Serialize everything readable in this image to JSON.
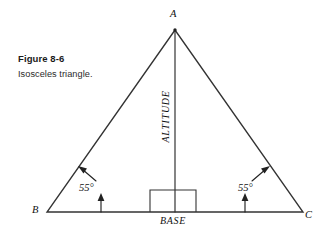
{
  "figure": {
    "caption_title": "Figure 8-6",
    "caption_subtitle": "Isosceles triangle.",
    "vertices": {
      "apex_label": "A",
      "left_label": "B",
      "right_label": "C"
    },
    "labels": {
      "altitude": "ALTITUDE",
      "base": "BASE"
    },
    "angles": {
      "left_angle": "55°",
      "right_angle": "55°"
    },
    "colors": {
      "background": "#ffffff",
      "line": "#333333",
      "text": "#111111",
      "caption": "#1a1a1a"
    },
    "geometry": {
      "apex": [
        175,
        30
      ],
      "left_vertex": [
        47,
        212
      ],
      "right_vertex": [
        303,
        212
      ],
      "altitude_foot": [
        175,
        212
      ],
      "right_angle_box": [
        150,
        190,
        46,
        22
      ]
    }
  }
}
